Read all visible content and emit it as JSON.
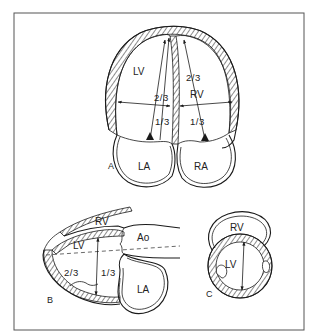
{
  "figure": {
    "frame_color": "#555555",
    "panels": [
      {
        "id": "A",
        "label": "A",
        "view": "apical four-chamber",
        "chambers": [
          "LV",
          "RV",
          "LA",
          "RA"
        ],
        "annotations": {
          "lv_label": "LV",
          "rv_label": "RV",
          "la_label": "LA",
          "ra_label": "RA",
          "lv_upper_fraction": "2/3",
          "lv_lower_fraction": "1/3",
          "rv_upper_fraction": "2/3",
          "rv_lower_fraction": "1/3"
        }
      },
      {
        "id": "B",
        "label": "B",
        "view": "parasternal long-axis",
        "chambers": [
          "RV",
          "LV",
          "Ao",
          "LA"
        ],
        "annotations": {
          "rv_label": "RV",
          "lv_label": "LV",
          "ao_label": "Ao",
          "la_label": "LA",
          "apical_fraction": "2/3",
          "basal_fraction": "1/3"
        }
      },
      {
        "id": "C",
        "label": "C",
        "view": "short-axis",
        "chambers": [
          "RV",
          "LV"
        ],
        "annotations": {
          "rv_label": "RV",
          "lv_label": "LV"
        }
      }
    ]
  }
}
